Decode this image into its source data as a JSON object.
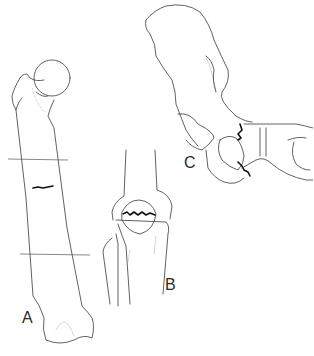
{
  "figure": {
    "panels": [
      {
        "id": "A",
        "label": "A",
        "subject": "femur",
        "fracture": "transverse mid-shaft fracture"
      },
      {
        "id": "B",
        "label": "B",
        "subject": "knee",
        "fracture": "transverse patellar fracture"
      },
      {
        "id": "C",
        "label": "C",
        "subject": "foot (tarsal bones)",
        "fracture": "fracture lines across tarsal bones"
      }
    ]
  }
}
